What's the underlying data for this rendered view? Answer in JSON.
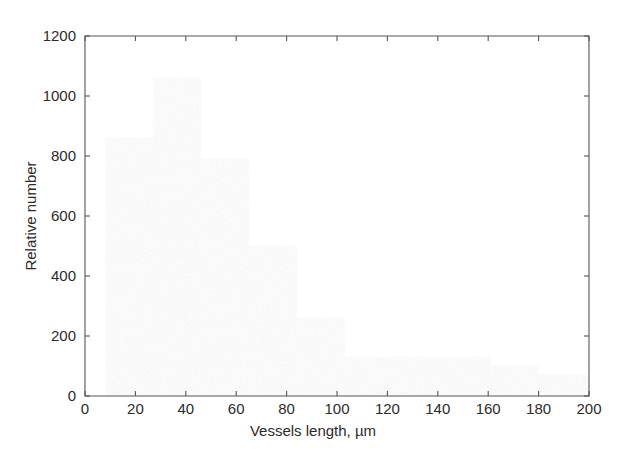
{
  "chart_data": {
    "type": "bar",
    "title": "",
    "subtitle": "",
    "xlabel": "Vessels length, µm",
    "ylabel": "Relative number",
    "xlim": [
      0,
      200
    ],
    "ylim": [
      0,
      1200
    ],
    "grid": false,
    "legend": null,
    "bar_style": "histogram",
    "bin_edges": [
      8,
      27,
      46,
      65,
      84,
      103,
      122,
      142,
      161,
      180,
      200
    ],
    "categories": [
      "8-27",
      "27-46",
      "46-65",
      "65-84",
      "84-103",
      "103-122",
      "122-142",
      "142-161",
      "161-180",
      "180-200"
    ],
    "values": [
      860,
      1060,
      790,
      500,
      260,
      130,
      130,
      130,
      100,
      70
    ],
    "bar_color": "#4a4a4a",
    "xticks": [
      0,
      20,
      40,
      60,
      80,
      100,
      120,
      140,
      160,
      180,
      200
    ],
    "xtick_labels": [
      "0",
      "20",
      "40",
      "60",
      "80",
      "100",
      "120",
      "140",
      "160",
      "180",
      "200"
    ],
    "yticks": [
      0,
      200,
      400,
      600,
      800,
      1000,
      1200
    ],
    "ytick_labels": [
      "0",
      "200",
      "400",
      "600",
      "800",
      "1000",
      "1200"
    ]
  },
  "axes": {
    "x_title": "Vessels length, µm",
    "y_title": "Relative number"
  }
}
